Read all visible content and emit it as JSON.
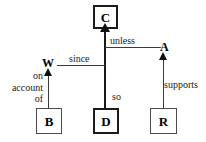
{
  "diagram": {
    "type": "argument-structure-diagram",
    "canvas": {
      "width": 206,
      "height": 142,
      "background": "#ffffff"
    },
    "nodes": [
      {
        "id": "C",
        "label": "C",
        "shape": "box",
        "border": "thick",
        "x": 93,
        "y": 5,
        "w": 25,
        "h": 24
      },
      {
        "id": "B",
        "label": "B",
        "shape": "box",
        "border": "thin",
        "x": 36,
        "y": 108,
        "w": 26,
        "h": 26
      },
      {
        "id": "D",
        "label": "D",
        "shape": "box",
        "border": "thick",
        "x": 93,
        "y": 108,
        "w": 26,
        "h": 26
      },
      {
        "id": "R",
        "label": "R",
        "shape": "box",
        "border": "thin",
        "x": 150,
        "y": 108,
        "w": 27,
        "h": 26
      },
      {
        "id": "W",
        "label": "W",
        "shape": "plain",
        "x": 42,
        "y": 57
      },
      {
        "id": "A",
        "label": "A",
        "shape": "plain",
        "x": 160,
        "y": 41
      }
    ],
    "edges": [
      {
        "id": "d-to-c",
        "from": "D",
        "to": "C",
        "label": "so",
        "weight": "thick",
        "direction": "up"
      },
      {
        "id": "b-to-w",
        "from": "B",
        "to": "W",
        "label": "on\naccount\nof",
        "weight": "thin",
        "direction": "up"
      },
      {
        "id": "r-to-a",
        "from": "R",
        "to": "A",
        "label": "supports",
        "weight": "thin",
        "direction": "up"
      },
      {
        "id": "w-since",
        "from": "W",
        "to": "d-to-c",
        "label": "since",
        "weight": "thin",
        "direction": "horizontal-right"
      },
      {
        "id": "a-unless",
        "from": "A",
        "to": "d-to-c",
        "label": "unless",
        "weight": "thin",
        "direction": "horizontal-left"
      }
    ],
    "labels": {
      "node_c": "C",
      "node_b": "B",
      "node_d": "D",
      "node_r": "R",
      "node_w": "W",
      "node_a": "A",
      "edge_so": "so",
      "edge_since": "since",
      "edge_unless": "unless",
      "edge_supports": "supports",
      "edge_on": "on",
      "edge_account": "account",
      "edge_of": "of"
    },
    "colors": {
      "stroke": "#1a1a1a",
      "stroke_light": "#3a3a3a",
      "text": "#000000",
      "background": "#ffffff"
    }
  }
}
